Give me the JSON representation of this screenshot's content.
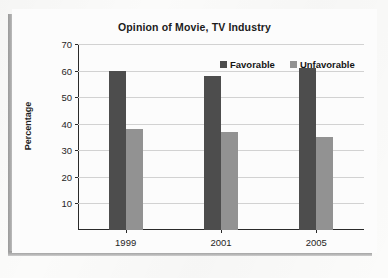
{
  "chart_data": {
    "type": "bar",
    "title": "Opinion of Movie, TV Industry",
    "xlabel": "",
    "ylabel": "Percentage",
    "categories": [
      "1999",
      "2001",
      "2005"
    ],
    "series": [
      {
        "name": "Favorable",
        "color": "#4d4d4d",
        "values": [
          60,
          58,
          61
        ]
      },
      {
        "name": "Unfavorable",
        "color": "#929292",
        "values": [
          38,
          37,
          35
        ]
      }
    ],
    "ylim": [
      0,
      70
    ],
    "yticks": [
      10,
      20,
      30,
      40,
      50,
      60,
      70
    ],
    "grid": true,
    "legend_position": "top-right"
  },
  "legend": {
    "items": [
      {
        "label": "Favorable",
        "color": "#4d4d4d"
      },
      {
        "label": "Unfavorable",
        "color": "#929292"
      }
    ]
  }
}
